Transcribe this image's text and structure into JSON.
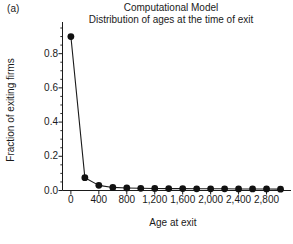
{
  "figure": {
    "panel_label": "(a)",
    "title_main": "Computational Model",
    "title_sub": "Distribution of ages at the time of exit"
  },
  "axes": {
    "x_title": "Age at exit",
    "y_title": "Fraction of exiting firms",
    "y_ticks": [
      "0.0",
      "0.2",
      "0.4",
      "0.6",
      "0.8"
    ],
    "x_ticks": [
      "0",
      "400",
      "800",
      "1,200",
      "1,600",
      "2,000",
      "2,400",
      "2,800"
    ]
  },
  "style": {
    "line_color": "#1a1a1a",
    "marker_color": "#111111",
    "axis_color": "#1a1a1a",
    "background": "#ffffff"
  },
  "chart_data": {
    "type": "line",
    "subtitle": "Distribution of ages at the time of exit",
    "xlabel": "Age at exit",
    "ylabel": "Fraction of exiting firms",
    "xlim": [
      -120,
      3150
    ],
    "ylim": [
      0.0,
      0.95
    ],
    "xticks": [
      0,
      400,
      800,
      1200,
      1600,
      2000,
      2400,
      2800
    ],
    "xticklabels": [
      "0",
      "400",
      "800",
      "1,200",
      "1,600",
      "2,000",
      "2,400",
      "2,800"
    ],
    "yticks": [
      0.0,
      0.2,
      0.4,
      0.6,
      0.8
    ],
    "yticklabels": [
      "0.0",
      "0.2",
      "0.4",
      "0.6",
      "0.8"
    ],
    "y_minor_tick_step": 0.05,
    "grid": false,
    "legend": false,
    "marker": "filled-circle",
    "series": [
      {
        "name": "Fraction of exiting firms",
        "x": [
          0,
          200,
          400,
          600,
          800,
          1000,
          1200,
          1400,
          1600,
          1800,
          2000,
          2200,
          2400,
          2600,
          2800,
          3000
        ],
        "values": [
          0.9,
          0.075,
          0.03,
          0.018,
          0.015,
          0.013,
          0.012,
          0.011,
          0.011,
          0.01,
          0.01,
          0.01,
          0.009,
          0.009,
          0.009,
          0.008
        ]
      }
    ]
  }
}
